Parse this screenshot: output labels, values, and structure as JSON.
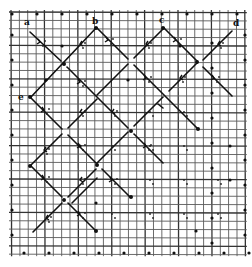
{
  "figure": {
    "type": "lattice-path-diagram",
    "corner_labels": [
      {
        "id": "a",
        "text": "a"
      },
      {
        "id": "b",
        "text": "b"
      },
      {
        "id": "c",
        "text": "c"
      },
      {
        "id": "d",
        "text": "d"
      },
      {
        "id": "e",
        "text": "e"
      }
    ],
    "colors": {
      "background": "#ffffff",
      "grid": "#5a5a5a",
      "ink": "#111111"
    }
  }
}
